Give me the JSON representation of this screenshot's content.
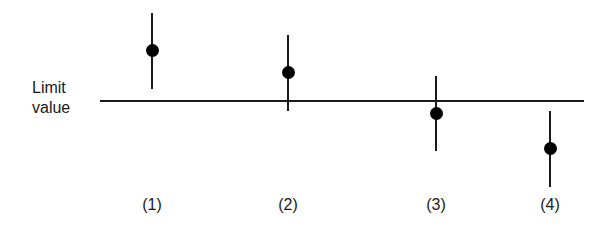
{
  "diagram": {
    "limit_label_line1": "Limit",
    "limit_label_line2": "value",
    "points": [
      {
        "label": "(1)",
        "x": 152,
        "dot_y": 50,
        "bar_top": 13,
        "bar_bottom": 89
      },
      {
        "label": "(2)",
        "x": 288,
        "dot_y": 72,
        "bar_top": 35,
        "bar_bottom": 111
      },
      {
        "label": "(3)",
        "x": 436,
        "dot_y": 113,
        "bar_top": 76,
        "bar_bottom": 151
      },
      {
        "label": "(4)",
        "x": 550,
        "dot_y": 148,
        "bar_top": 111,
        "bar_bottom": 187
      }
    ]
  },
  "chart_data": {
    "type": "scatter",
    "title": "",
    "xlabel": "",
    "ylabel": "",
    "categories": [
      "(1)",
      "(2)",
      "(3)",
      "(4)"
    ],
    "reference_line": {
      "label": "Limit value",
      "y": 0
    },
    "series": [
      {
        "name": "measurement with uncertainty",
        "values": [
          51,
          29,
          -12,
          -47
        ],
        "error_low": [
          39,
          39,
          38,
          38
        ],
        "error_high": [
          37,
          37,
          37,
          37
        ]
      }
    ],
    "note": "Relative units: positive = above limit value, negative = below. (1) entirely above, (2) mean above but interval crosses, (3) mean below but interval crosses, (4) entirely below."
  }
}
